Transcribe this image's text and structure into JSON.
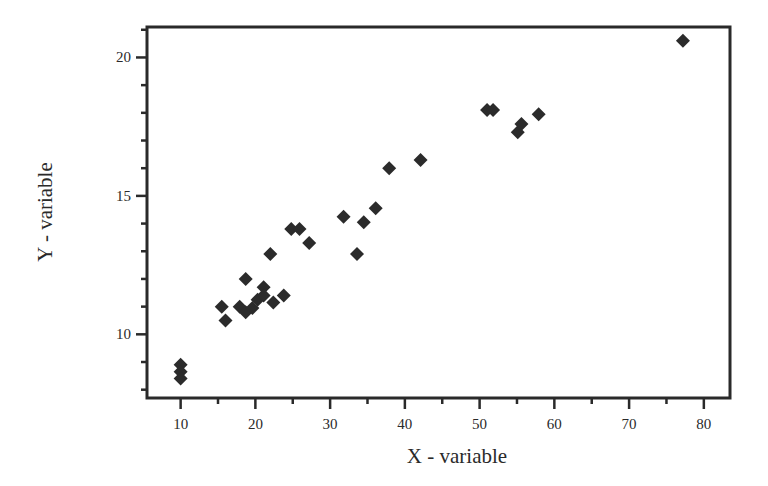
{
  "chart_data": {
    "type": "scatter",
    "title": "",
    "xlabel": "X - variable",
    "ylabel": "Y - variable",
    "xlim": [
      5.5,
      83.5
    ],
    "ylim": [
      7.7,
      21.1
    ],
    "xticks": [
      10,
      20,
      30,
      40,
      50,
      60,
      70,
      80
    ],
    "yticks": [
      10,
      15,
      20
    ],
    "x_minor_step": 5,
    "y_minor_step": 1,
    "grid": false,
    "legend": null,
    "marker": "diamond",
    "marker_color": "#2b2b2b",
    "series": [
      {
        "name": "data",
        "points": [
          [
            10.0,
            8.9
          ],
          [
            10.0,
            8.65
          ],
          [
            10.0,
            8.4
          ],
          [
            15.5,
            11.0
          ],
          [
            16.0,
            10.5
          ],
          [
            17.9,
            11.0
          ],
          [
            18.7,
            12.0
          ],
          [
            18.7,
            10.8
          ],
          [
            19.6,
            10.95
          ],
          [
            20.3,
            11.25
          ],
          [
            21.1,
            11.7
          ],
          [
            21.1,
            11.4
          ],
          [
            22.0,
            12.9
          ],
          [
            22.4,
            11.15
          ],
          [
            23.8,
            11.4
          ],
          [
            24.8,
            13.8
          ],
          [
            25.9,
            13.8
          ],
          [
            27.2,
            13.3
          ],
          [
            31.8,
            14.25
          ],
          [
            33.6,
            12.9
          ],
          [
            34.5,
            14.05
          ],
          [
            36.1,
            14.55
          ],
          [
            37.9,
            16.0
          ],
          [
            42.1,
            16.3
          ],
          [
            51.0,
            18.1
          ],
          [
            51.8,
            18.1
          ],
          [
            55.1,
            17.3
          ],
          [
            55.6,
            17.6
          ],
          [
            57.9,
            17.95
          ],
          [
            77.2,
            20.6
          ]
        ]
      }
    ]
  }
}
